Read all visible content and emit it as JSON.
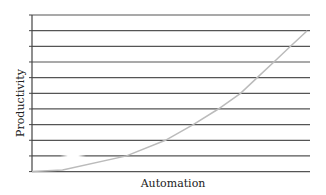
{
  "chart_data": {
    "type": "line",
    "title": "",
    "xlabel": "Automation",
    "ylabel": "Productivity",
    "xlim": [
      0,
      100
    ],
    "ylim": [
      0,
      10
    ],
    "grid": true,
    "grid_axis": "y",
    "grid_lines": 11,
    "tick_labels_shown": false,
    "legend": null,
    "series": [
      {
        "name": "Productivity vs Automation",
        "style": "light-gray curve",
        "x": [
          0,
          11,
          34,
          48,
          58,
          67,
          75,
          81,
          87,
          93,
          99
        ],
        "y": [
          0,
          0.1,
          1,
          2,
          3,
          4,
          5,
          6,
          7,
          8,
          9
        ]
      }
    ],
    "colors": {
      "grid": "#555555",
      "axis": "#444444",
      "curve": "#bbbbbb"
    }
  },
  "labels": {
    "x_axis": "Automation",
    "y_axis": "Productivity"
  }
}
